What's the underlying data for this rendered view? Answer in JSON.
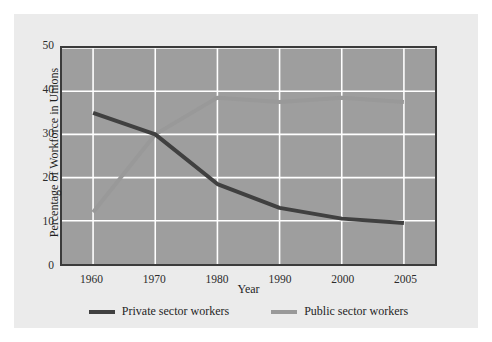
{
  "chart_data": {
    "type": "line",
    "title": "",
    "xlabel": "Year",
    "ylabel": "Percentage of Workforce in Unions",
    "x": [
      1960,
      1970,
      1980,
      1990,
      2000,
      2005
    ],
    "xtick_labels": [
      "1960",
      "1970",
      "1980",
      "1990",
      "2000",
      "2005"
    ],
    "ytick_labels": [
      "0",
      "10",
      "20",
      "30",
      "40",
      "50"
    ],
    "yticks": [
      0,
      10,
      20,
      30,
      40,
      50
    ],
    "ylim": [
      0,
      50
    ],
    "grid": true,
    "legend_position": "below-plot-center",
    "plot_background": "#9e9e9e",
    "gridline_color": "#ffffff",
    "frame_color": "#3b3b3b",
    "series": [
      {
        "name": "Private sector workers",
        "color": "#404040",
        "values": [
          35.0,
          30.0,
          18.5,
          13.0,
          10.5,
          9.5
        ]
      },
      {
        "name": "Public sector workers",
        "color": "#999999",
        "values": [
          12.0,
          30.0,
          38.5,
          37.5,
          38.5,
          37.5
        ]
      }
    ]
  }
}
